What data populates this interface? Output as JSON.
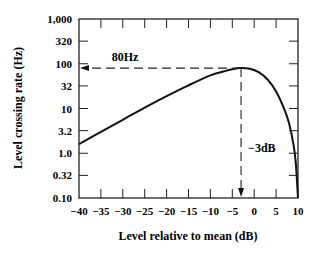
{
  "chart_data": {
    "type": "line",
    "title": "",
    "xlabel": "Level relative to mean (dB)",
    "ylabel": "Level crossing rate (Hz)",
    "xlim": [
      -40,
      10
    ],
    "ylim": [
      0.1,
      1000
    ],
    "yscale": "log",
    "grid": false,
    "legend": null,
    "x_ticks": [
      -40,
      -35,
      -30,
      -25,
      -20,
      -15,
      -10,
      -5,
      0,
      5,
      10
    ],
    "x_tick_labels": [
      "−40",
      "−35",
      "−30",
      "−25",
      "−20",
      "−15",
      "−10",
      "−5",
      "0",
      "5",
      "10"
    ],
    "y_ticks": [
      0.1,
      0.32,
      1.0,
      3.2,
      10,
      32,
      100,
      320,
      1000
    ],
    "y_tick_labels": [
      "0.10",
      "0.32",
      "1.0",
      "3.2",
      "10",
      "32",
      "100",
      "320",
      "1,000"
    ],
    "series": [
      {
        "name": "Level crossing rate",
        "x": [
          -40,
          -35,
          -30,
          -25,
          -20,
          -15,
          -10,
          -7,
          -5,
          -3,
          -1,
          1,
          3,
          5,
          7,
          8,
          9,
          9.5,
          10
        ],
        "y": [
          1.6,
          3.0,
          5.6,
          10.5,
          19,
          33,
          55,
          67,
          75,
          80,
          77,
          65,
          45,
          24,
          9,
          4.5,
          1.5,
          0.6,
          0.1
        ]
      }
    ],
    "annotations": [
      {
        "text": "80Hz",
        "type": "dashed-arrow-to-y-axis",
        "from": [
          -3,
          80
        ],
        "to_y": 80
      },
      {
        "text": "−3dB",
        "type": "dashed-arrow-to-x-axis",
        "from": [
          -3,
          80
        ],
        "to_x": -3
      }
    ]
  }
}
